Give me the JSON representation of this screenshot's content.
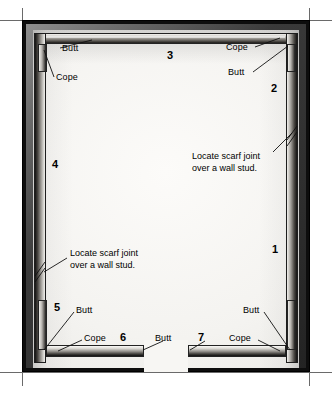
{
  "figure": {
    "interior_color": "#f4f3f0",
    "frame_color": "#0d0d0d",
    "molding_highlight": "#f2f1ee"
  },
  "notes": [
    {
      "id": "note-right",
      "line1": "Locate scarf joint",
      "line2": "over a wall stud."
    },
    {
      "id": "note-left",
      "line1": "Locate scarf joint",
      "line2": "over a wall stud."
    }
  ],
  "piece_numbers": [
    {
      "id": "1",
      "label": "1"
    },
    {
      "id": "2",
      "label": "2"
    },
    {
      "id": "3",
      "label": "3"
    },
    {
      "id": "4",
      "label": "4"
    },
    {
      "id": "5",
      "label": "5"
    },
    {
      "id": "6",
      "label": "6"
    },
    {
      "id": "7",
      "label": "7"
    }
  ],
  "joint_labels": [
    {
      "id": "top-left-butt",
      "text": "Butt"
    },
    {
      "id": "top-left-cope",
      "text": "Cope"
    },
    {
      "id": "top-right-cope",
      "text": "Cope"
    },
    {
      "id": "top-right-butt",
      "text": "Butt"
    },
    {
      "id": "bottom-left-butt",
      "text": "Butt"
    },
    {
      "id": "bottom-left-cope",
      "text": "Cope"
    },
    {
      "id": "bottom-mid-butt",
      "text": "Butt"
    },
    {
      "id": "bottom-right-butt",
      "text": "Butt"
    },
    {
      "id": "bottom-right-cope",
      "text": "Cope"
    }
  ]
}
